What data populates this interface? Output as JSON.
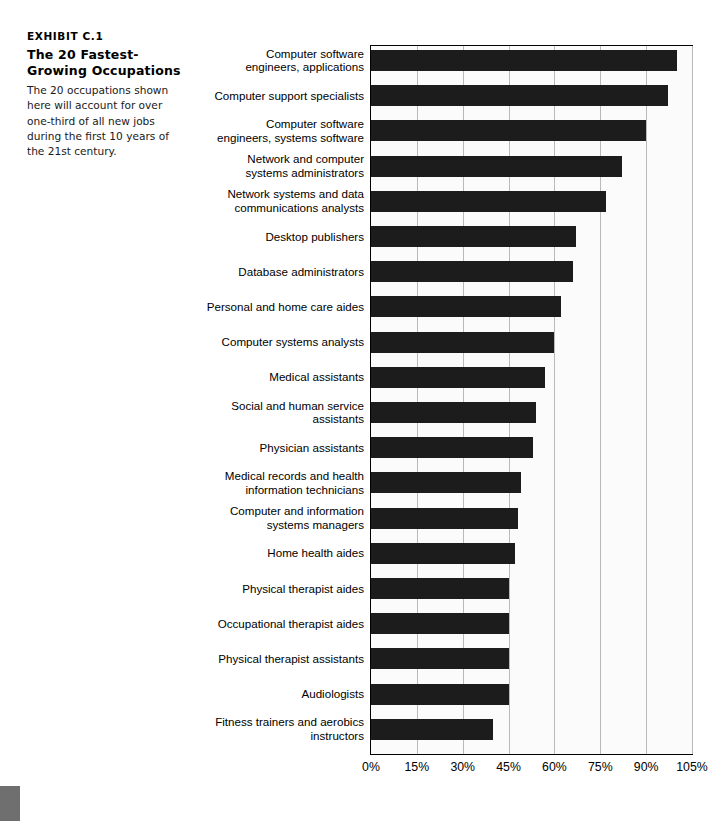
{
  "exhibit": {
    "number": "EXHIBIT C.1",
    "title": "The 20 Fastest-Growing Occupations",
    "description": "The 20 occupations shown here will account for over one-third of all new jobs during the first 10 years of the 21st century."
  },
  "chart_data": {
    "type": "bar",
    "orientation": "horizontal",
    "title": "The 20 Fastest-Growing Occupations",
    "xlabel": "",
    "ylabel": "",
    "xlim": [
      0,
      105
    ],
    "grid": true,
    "legend": null,
    "bar_color": "#1c1c1c",
    "tick_labels": [
      "0%",
      "15%",
      "30%",
      "45%",
      "60%",
      "75%",
      "90%",
      "105%"
    ],
    "tick_values": [
      0,
      15,
      30,
      45,
      60,
      75,
      90,
      105
    ],
    "categories": [
      "Computer software\nengineers, applications",
      "Computer support specialists",
      "Computer software\nengineers, systems software",
      "Network and computer\nsystems administrators",
      "Network systems and data\ncommunications analysts",
      "Desktop publishers",
      "Database administrators",
      "Personal and home care aides",
      "Computer systems analysts",
      "Medical assistants",
      "Social and human service\nassistants",
      "Physician assistants",
      "Medical records and health\ninformation technicians",
      "Computer and information\nsystems managers",
      "Home health aides",
      "Physical therapist aides",
      "Occupational therapist aides",
      "Physical therapist assistants",
      "Audiologists",
      "Fitness trainers and aerobics\ninstructors"
    ],
    "values": [
      100,
      97,
      90,
      82,
      77,
      67,
      66,
      62,
      60,
      57,
      54,
      53,
      49,
      48,
      47,
      45,
      45,
      45,
      45,
      40
    ]
  }
}
